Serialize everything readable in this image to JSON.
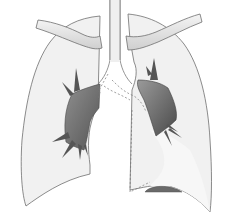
{
  "image": {
    "subject": "Frontal illustration of human lungs with shaded hilar masses",
    "width": 235,
    "height": 218,
    "colors": {
      "background": "#ffffff",
      "lung_fill": "#f1f1f1",
      "lung_outline": "#6e6e6e",
      "clavicle_fill": "#e4e4e4",
      "mass_dark": "#5c5c5c",
      "mass_light": "#8f8f8f",
      "dashed_line": "#777777",
      "diaphragm_shadow": "#6a6a6a"
    },
    "elements": [
      {
        "name": "right-lung",
        "side": "viewer-left"
      },
      {
        "name": "left-lung",
        "side": "viewer-right"
      },
      {
        "name": "trachea"
      },
      {
        "name": "left-clavicle"
      },
      {
        "name": "right-clavicle"
      },
      {
        "name": "right-hilar-mass"
      },
      {
        "name": "left-hilar-mass"
      },
      {
        "name": "heart-outline-dashed"
      },
      {
        "name": "diaphragm-shadow"
      }
    ]
  }
}
